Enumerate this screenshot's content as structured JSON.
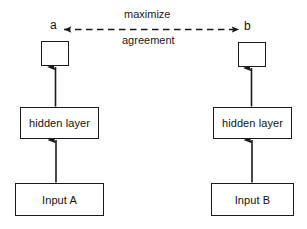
{
  "diagram": {
    "objective": {
      "line1": "maximize",
      "line2": "agreement"
    },
    "branches": [
      {
        "id": "left",
        "output_label": "a",
        "hidden_label": "hidden layer",
        "input_label": "Input A"
      },
      {
        "id": "right",
        "output_label": "b",
        "hidden_label": "hidden layer",
        "input_label": "Input B"
      }
    ],
    "connector": {
      "style": "dashed",
      "arrowheads": "both",
      "from": "a",
      "to": "b"
    },
    "colors": {
      "background": "#ffffff",
      "stroke": "#1a1a1a",
      "text": "#111111"
    }
  }
}
